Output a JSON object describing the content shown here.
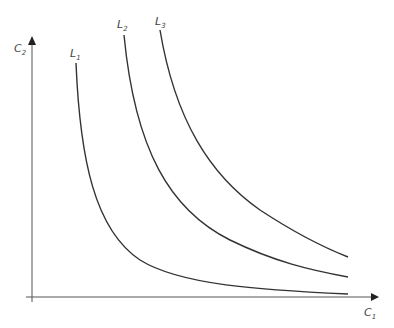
{
  "diagram": {
    "type": "isoquant/indifference curves",
    "axes": {
      "y": {
        "label": "C",
        "subscript": "2"
      },
      "x": {
        "label": "C",
        "subscript": "1"
      }
    },
    "curves": [
      {
        "label": "L",
        "subscript": "1"
      },
      {
        "label": "L",
        "subscript": "2"
      },
      {
        "label": "L",
        "subscript": "3"
      }
    ],
    "colors": {
      "axis": "#555555",
      "curve": "#333333",
      "text": "#444444"
    }
  }
}
